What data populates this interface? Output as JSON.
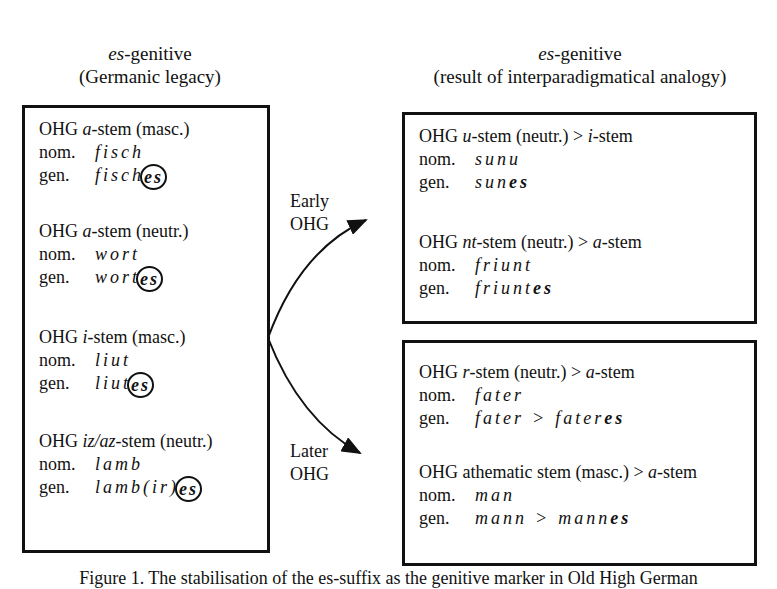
{
  "headers": {
    "left": {
      "italic": "es",
      "text": "-genitive",
      "sub": "(Germanic legacy)"
    },
    "right": {
      "italic": "es",
      "text": "-genitive",
      "sub": "(result of interparadigmatical analogy)"
    }
  },
  "left_box": {
    "groups": [
      {
        "pre": "OHG ",
        "stem": "a",
        "post": "-stem (masc.)",
        "nom_label": "nom.",
        "nom": "fisch",
        "gen_label": "gen.",
        "gen_base": "fisch",
        "gen_suffix": "es"
      },
      {
        "pre": "OHG ",
        "stem": "a",
        "post": "-stem (neutr.)",
        "nom_label": "nom.",
        "nom": "wort",
        "gen_label": "gen.",
        "gen_base": "wort",
        "gen_suffix": "es"
      },
      {
        "pre": "OHG ",
        "stem": "i",
        "post": "-stem (masc.)",
        "nom_label": "nom.",
        "nom": "liut",
        "gen_label": "gen.",
        "gen_base": "liut",
        "gen_suffix": "es"
      },
      {
        "pre": "OHG ",
        "stem": "iz/az",
        "post": "-stem (neutr.)",
        "nom_label": "nom.",
        "nom": "lamb",
        "gen_label": "gen.",
        "gen_base": "lamb(ir)",
        "gen_suffix": "es"
      }
    ]
  },
  "arrows": {
    "early": [
      "Early",
      "OHG"
    ],
    "later": [
      "Later",
      "OHG"
    ]
  },
  "right_top_box": {
    "groups": [
      {
        "pre": "OHG ",
        "stem": "u",
        "post": "-stem (neutr.) > ",
        "target": "i",
        "target_post": "-stem",
        "nom_label": "nom.",
        "nom": "sunu",
        "gen_label": "gen.",
        "gen_base": "sun",
        "gen_suffix": "es"
      },
      {
        "pre": "OHG ",
        "stem": "nt",
        "post": "-stem (neutr.) > ",
        "target": "a",
        "target_post": "-stem",
        "nom_label": "nom.",
        "nom": "friunt",
        "gen_label": "gen.",
        "gen_base": "friunt",
        "gen_suffix": "es"
      }
    ]
  },
  "right_bottom_box": {
    "groups": [
      {
        "pre": "OHG ",
        "stem": "r",
        "post": "-stem (neutr.) > ",
        "target": "a",
        "target_post": "-stem",
        "nom_label": "nom.",
        "nom": "fater",
        "gen_label": "gen.",
        "gen_old": "fater",
        "gen_arrow": ">",
        "gen_base": "fater",
        "gen_suffix": "es"
      },
      {
        "pre": "OHG athematic stem (masc.) > ",
        "stem": "",
        "post": "",
        "target": "a",
        "target_post": "-stem",
        "nom_label": "nom.",
        "nom": "man",
        "gen_label": "gen.",
        "gen_old": "mann",
        "gen_arrow": ">",
        "gen_base": "mann",
        "gen_suffix": "es"
      }
    ]
  },
  "caption": "Figure 1. The stabilisation of the es-suffix as the genitive marker in Old High German"
}
